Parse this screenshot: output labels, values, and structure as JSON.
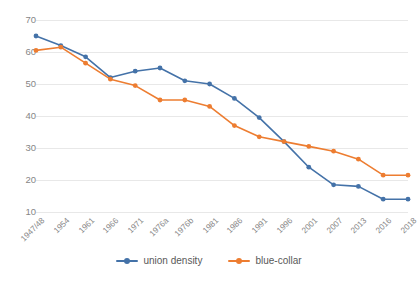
{
  "chart_data": {
    "type": "line",
    "title": "",
    "xlabel": "",
    "ylabel": "",
    "ylim": [
      10,
      70
    ],
    "yticks": [
      10,
      20,
      30,
      40,
      50,
      60,
      70
    ],
    "grid": true,
    "legend_position": "bottom",
    "categories": [
      "1947/48",
      "1954",
      "1961",
      "1966",
      "1971",
      "1976a",
      "1976b",
      "1981",
      "1986",
      "1991",
      "1996",
      "2001",
      "2007",
      "2013",
      "2016",
      "2018"
    ],
    "series": [
      {
        "name": "union density",
        "color": "#4472a8",
        "values": [
          65,
          62,
          58.5,
          52,
          54,
          55,
          51,
          50,
          45.5,
          39.5,
          32,
          24,
          18.5,
          18,
          14,
          14
        ]
      },
      {
        "name": "blue-collar",
        "color": "#ed7d31",
        "values": [
          60.5,
          61.5,
          56.5,
          51.5,
          49.5,
          45,
          45,
          43,
          37,
          33.5,
          32,
          30.5,
          29,
          26.5,
          21.5,
          21.5
        ]
      }
    ]
  },
  "legend": {
    "items": [
      {
        "label": "union density",
        "color": "#4472a8"
      },
      {
        "label": "blue-collar",
        "color": "#ed7d31"
      }
    ]
  },
  "colors": {
    "gridline": "#e8e8e8",
    "tick_text": "#868686",
    "legend_text": "#595959",
    "background": "#ffffff"
  }
}
